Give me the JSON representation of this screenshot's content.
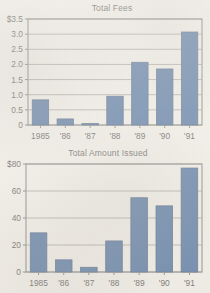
{
  "page": {
    "background_color": "#f2efe9",
    "bar_color": "#1b4a88",
    "bar_edge_color": "#13305c",
    "axis_color": "#5b5b57",
    "gridline_color": "#8d8b85",
    "text_color": "#232323"
  },
  "charts": [
    {
      "id": "total-fees",
      "chart_data": {
        "type": "bar",
        "title": "Total Fees",
        "xlabel": "",
        "ylabel": "",
        "categories": [
          "1985",
          "'86",
          "'87",
          "'88",
          "'89",
          "'90",
          "'91"
        ],
        "values": [
          0.83,
          0.2,
          0.05,
          0.95,
          2.07,
          1.85,
          3.07
        ],
        "ylim": [
          0,
          3.5
        ],
        "ytick_values": [
          0,
          0.5,
          1.0,
          1.5,
          2.0,
          2.5,
          3.0,
          3.5
        ],
        "ytick_labels": [
          "0",
          "0.5",
          "1.0",
          "1.5",
          "2.0",
          "2.5",
          "3.0",
          "$3.5"
        ],
        "grid": true,
        "legend": false,
        "series": [
          {
            "name": "Total Fees",
            "values": [
              0.83,
              0.2,
              0.05,
              0.95,
              2.07,
              1.85,
              3.07
            ]
          }
        ]
      }
    },
    {
      "id": "total-amount-issued",
      "chart_data": {
        "type": "bar",
        "title": "Total Amount Issued",
        "xlabel": "",
        "ylabel": "",
        "categories": [
          "1985",
          "'86",
          "'87",
          "'88",
          "'89",
          "'90",
          "'91"
        ],
        "values": [
          29,
          9,
          3.5,
          23,
          55,
          49,
          77
        ],
        "ylim": [
          0,
          80
        ],
        "ytick_values": [
          0,
          20,
          40,
          60,
          80
        ],
        "ytick_labels": [
          "0",
          "20",
          "40",
          "60",
          "$80"
        ],
        "grid": true,
        "legend": false,
        "series": [
          {
            "name": "Total Amount Issued",
            "values": [
              29,
              9,
              3.5,
              23,
              55,
              49,
              77
            ]
          }
        ]
      }
    }
  ]
}
